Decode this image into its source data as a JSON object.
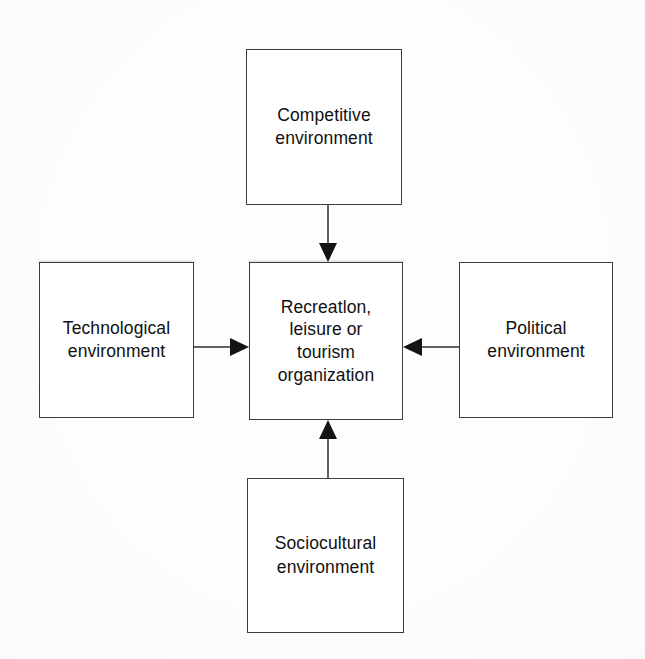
{
  "diagram": {
    "type": "hub-and-spoke",
    "background_color": "#fdfdfc",
    "line_color": "#2e2e2e",
    "border_color": "#3c3c3c",
    "text_color": "#111111",
    "center": {
      "id": "center",
      "label": "Recreatlon,\nleisure or\ntourism\norganization",
      "position": "center",
      "x": 249,
      "y": 262,
      "width": 154,
      "height": 158
    },
    "nodes": [
      {
        "id": "competitive",
        "label": "Competitive\nenvironment",
        "position": "top",
        "x": 246,
        "y": 49,
        "width": 156,
        "height": 156
      },
      {
        "id": "technological",
        "label": "Technological\nenvironment",
        "position": "left",
        "x": 39,
        "y": 262,
        "width": 155,
        "height": 156
      },
      {
        "id": "political",
        "label": "Political\nenvironment",
        "position": "right",
        "x": 459,
        "y": 262,
        "width": 154,
        "height": 156
      },
      {
        "id": "sociocultural",
        "label": "Sociocultural\nenvironment",
        "position": "bottom",
        "x": 247,
        "y": 478,
        "width": 157,
        "height": 155
      }
    ],
    "connectors": [
      {
        "id": "competitive-to-center",
        "from": "competitive",
        "to": "center",
        "direction": "down",
        "arrowhead": "solid-triangle"
      },
      {
        "id": "technological-to-center",
        "from": "technological",
        "to": "center",
        "direction": "right",
        "arrowhead": "solid-triangle"
      },
      {
        "id": "political-to-center",
        "from": "political",
        "to": "center",
        "direction": "left",
        "arrowhead": "solid-triangle"
      },
      {
        "id": "sociocultural-to-center",
        "from": "sociocultural",
        "to": "center",
        "direction": "up",
        "arrowhead": "solid-triangle"
      }
    ]
  }
}
